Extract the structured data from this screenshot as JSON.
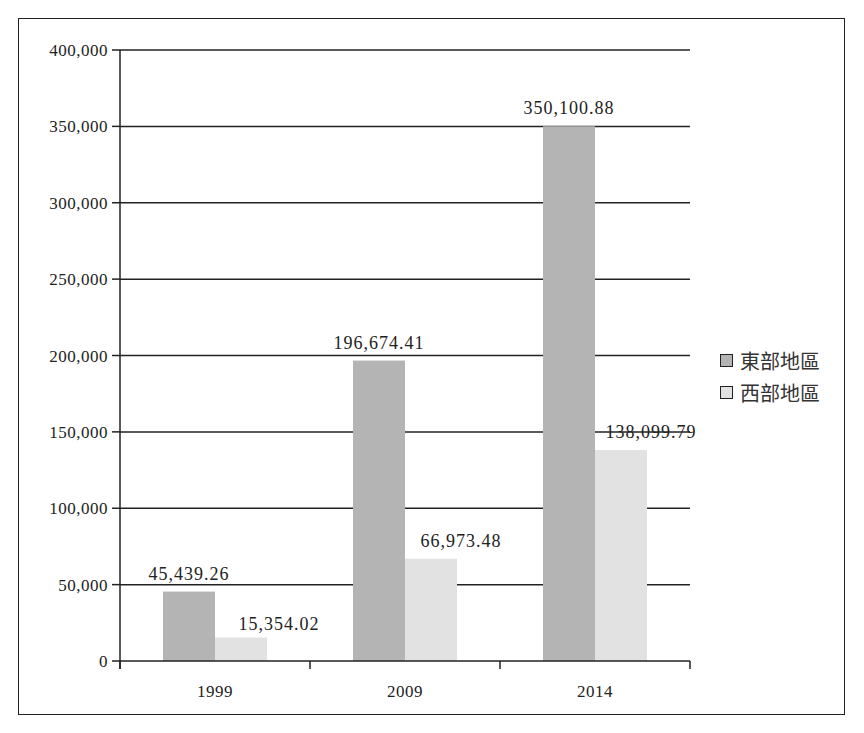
{
  "chart_data": {
    "type": "bar",
    "title": "",
    "xlabel": "",
    "ylabel": "",
    "categories": [
      "1999",
      "2009",
      "2014"
    ],
    "series": [
      {
        "name": "東部地區",
        "values": [
          45439.26,
          196674.41,
          350100.88
        ],
        "labels": [
          "45,439.26",
          "196,674.41",
          "350,100.88"
        ],
        "color": "#b4b4b4"
      },
      {
        "name": "西部地區",
        "values": [
          15354.02,
          66973.48,
          138099.79
        ],
        "labels": [
          "15,354.02",
          "66,973.48",
          "138,099.79"
        ],
        "color": "#e2e2e2"
      }
    ],
    "ylim": [
      0,
      400000
    ],
    "yticks": [
      0,
      50000,
      100000,
      150000,
      200000,
      250000,
      300000,
      350000,
      400000
    ],
    "ytick_labels": [
      "0",
      "50,000",
      "100,000",
      "150,000",
      "200,000",
      "250,000",
      "300,000",
      "350,000",
      "400,000"
    ],
    "grid": true,
    "legend_position": "right"
  },
  "legend": {
    "items": [
      {
        "label": "東部地區",
        "color": "#b4b4b4"
      },
      {
        "label": "西部地區",
        "color": "#e2e2e2"
      }
    ]
  }
}
